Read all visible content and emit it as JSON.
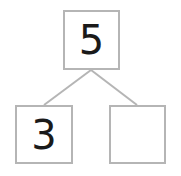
{
  "diagram": {
    "type": "number-bond",
    "whole": {
      "value": "5"
    },
    "parts": [
      {
        "value": "3"
      },
      {
        "value": ""
      }
    ]
  },
  "colors": {
    "border": "#b5b5b5",
    "line": "#b5b5b5",
    "text": "#1a1a1a",
    "background": "#ffffff"
  }
}
